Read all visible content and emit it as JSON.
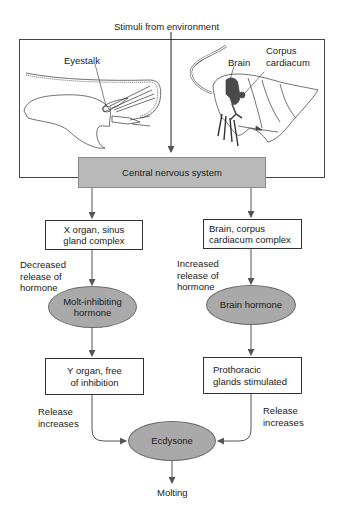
{
  "title": "Stimuli from environment",
  "illustrations": {
    "crustacean": {
      "label": "Eyestalk"
    },
    "insect": {
      "brain_label": "Brain",
      "corpus_label": "Corpus\ncardiacum"
    }
  },
  "central": {
    "label": "Central nervous system"
  },
  "left_pathway": {
    "gland_box": "X organ, sinus\ngland complex",
    "release_note": "Decreased\nrelease of\nhormone",
    "hormone": "Molt-inhibiting\nhormone",
    "target_box": "Y organ, free\nof inhibition",
    "release_label": "Release\nincreases"
  },
  "right_pathway": {
    "gland_box": "Brain, corpus\ncardiacum complex",
    "release_note": "Increased\nrelease of\nhormone",
    "hormone": "Brain hormone",
    "target_box": "Prothoracic\nglands stimulated",
    "release_label": "Release\nincreases"
  },
  "output": {
    "hormone": "Ecdysone",
    "result": "Molting"
  },
  "colors": {
    "node_fill": "#a9a9a9",
    "cns_fill": "#b9b9b9",
    "line": "#555555",
    "organ_dark": "#4a4a4a"
  }
}
